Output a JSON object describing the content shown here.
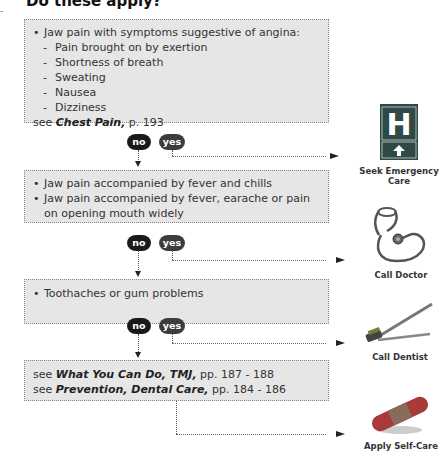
{
  "heading": "Do these apply?",
  "boxes": [
    {
      "bullet": "Jaw pain with symptoms suggestive of angina:",
      "subitems": [
        "Pain brought on by exertion",
        "Shortness of breath",
        "Sweating",
        "Nausea",
        "Dizziness"
      ],
      "ref_prefix": "see",
      "ref_title": "Chest Pain,",
      "ref_pages": "p. 193"
    },
    {
      "bullets": [
        "Jaw pain accompanied by fever and chills",
        "Jaw pain accompanied by fever, earache or pain on opening mouth widely"
      ]
    },
    {
      "bullets": [
        "Toothaches or gum problems"
      ]
    },
    {
      "refs": [
        {
          "prefix": "see",
          "title": "What You Can Do, TMJ,",
          "pages": "pp. 187 - 188"
        },
        {
          "prefix": "see",
          "title": "Prevention, Dental Care,",
          "pages": "pp. 184 - 186"
        }
      ]
    }
  ],
  "answers": {
    "no": "no",
    "yes": "yes"
  },
  "outcomes": [
    {
      "label": "Seek Emergency Care",
      "icon": "hospital-sign-icon"
    },
    {
      "label": "Call Doctor",
      "icon": "stethoscope-icon"
    },
    {
      "label": "Call Dentist",
      "icon": "toothbrush-icon"
    },
    {
      "label": "Apply Self-Care",
      "icon": "bandage-icon"
    }
  ]
}
